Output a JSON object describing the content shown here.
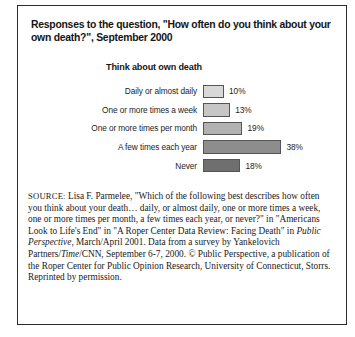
{
  "figure": {
    "title": "Responses to the question, \"How often do you think about your own death?\", September 2000",
    "chart_heading": "Think about own death"
  },
  "chart_data": {
    "type": "bar",
    "orientation": "horizontal",
    "title": "Think about own death",
    "xlabel": "",
    "ylabel": "",
    "xlim": [
      0,
      40
    ],
    "grid": false,
    "legend": "none",
    "categories": [
      "Daily or almost daily",
      "One or more times a week",
      "One or more times per month",
      "A few times each year",
      "Never"
    ],
    "values": [
      10,
      13,
      19,
      38,
      18
    ],
    "value_labels": [
      "10%",
      "13%",
      "19%",
      "38%",
      "18%"
    ],
    "bar_colors": [
      "#d8d8d8",
      "#c6c6c6",
      "#b2b2b2",
      "#8d8d8d",
      "#6f6f6f"
    ]
  },
  "source": {
    "label": "SOURCE:",
    "part1": " Lisa F. Parmelee, \"Which of the following best describes how often you think about your death… daily, or almost daily, one or more times a week, one or more times per month, a few times each year, or never?\" in \"Americans Look to Life's End\" in \"A Roper Center Data Review: Facing Death\" in ",
    "italic1": "Public Perspective",
    "part2": ", March/April 2001. Data from a survey by Yankelovich Partners/",
    "italic2": "Time",
    "part3": "/CNN, September 6-7, 2000. © Public Perspective, a publication of the Roper Center for Public Opinion Research, University of Connecticut, Storrs. Reprinted by permission."
  }
}
